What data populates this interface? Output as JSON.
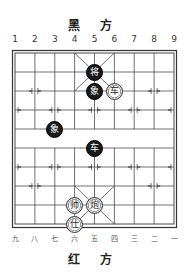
{
  "top_side": {
    "label": "黑 方"
  },
  "bottom_side": {
    "label": "红 方"
  },
  "top_files": [
    "1",
    "2",
    "3",
    "4",
    "5",
    "6",
    "7",
    "8",
    "9"
  ],
  "bottom_files": [
    "九",
    "八",
    "七",
    "六",
    "五",
    "四",
    "三",
    "二",
    "一"
  ],
  "board": {
    "columns": 9,
    "rows": 10,
    "line_color": "#333333",
    "river_text": ""
  },
  "pieces": [
    {
      "side": "black",
      "char": "将",
      "col": 5,
      "row": 2
    },
    {
      "side": "black",
      "char": "象",
      "col": 5,
      "row": 3
    },
    {
      "side": "red",
      "char": "车",
      "col": 6,
      "row": 3
    },
    {
      "side": "black",
      "char": "象",
      "col": 3,
      "row": 5
    },
    {
      "side": "black",
      "char": "车",
      "col": 5,
      "row": 6
    },
    {
      "side": "red",
      "char": "帅",
      "col": 4,
      "row": 9
    },
    {
      "side": "red",
      "char": "炮",
      "col": 5,
      "row": 9
    },
    {
      "side": "red",
      "char": "仕",
      "col": 4,
      "row": 10
    }
  ]
}
